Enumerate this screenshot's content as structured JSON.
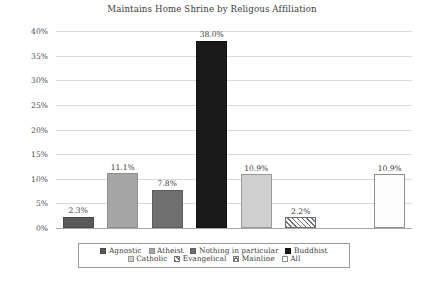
{
  "chart_data": {
    "type": "bar",
    "title": "Maintains Home Shrine by Religous Affiliation",
    "xlabel": "",
    "ylabel": "",
    "ylim": [
      0,
      40
    ],
    "ytick_labels": [
      "40%",
      "35%",
      "30%",
      "25%",
      "20%",
      "15%",
      "10%",
      "5%",
      "0%"
    ],
    "ytick_values": [
      40,
      35,
      30,
      25,
      20,
      15,
      10,
      5,
      0
    ],
    "grid": true,
    "legend_position": "bottom",
    "categories": [
      "Agnostic",
      "Atheist",
      "Nothing in particular",
      "Buddhist",
      "Catholic",
      "Evangelical",
      "Mainline",
      "All"
    ],
    "values": [
      2.3,
      11.1,
      7.8,
      38.0,
      10.9,
      2.2,
      0,
      10.9
    ],
    "data_labels": [
      "2.3%",
      "11.1%",
      "7.8%",
      "38.0%",
      "10.9%",
      "2.2%",
      "",
      "10.9%"
    ],
    "bar_styles": [
      "dark-gray",
      "light-gray",
      "mid-gray",
      "black",
      "pale-gray",
      "diag-hatch",
      "cross-hatch",
      "dotted"
    ]
  },
  "legend": {
    "row1": [
      {
        "label": "Agnostic",
        "style": "dark-gray"
      },
      {
        "label": "Atheist",
        "style": "light-gray"
      },
      {
        "label": "Nothing in particular",
        "style": "mid-gray"
      },
      {
        "label": "Buddhist",
        "style": "black"
      }
    ],
    "row2": [
      {
        "label": "Catholic",
        "style": "pale-gray"
      },
      {
        "label": "Evangelical",
        "style": "diag-hatch"
      },
      {
        "label": "Mainline",
        "style": "cross-hatch"
      },
      {
        "label": "All",
        "style": "dotted"
      }
    ]
  },
  "colors": {
    "dark_gray": "#595959",
    "light_gray": "#a6a6a6",
    "mid_gray": "#6f6f6f",
    "black": "#1a1a1a",
    "pale_gray": "#cfcfcf",
    "gridline": "#d9d9d9",
    "axis": "#a8a8a8",
    "text": "#3b3b3b"
  }
}
